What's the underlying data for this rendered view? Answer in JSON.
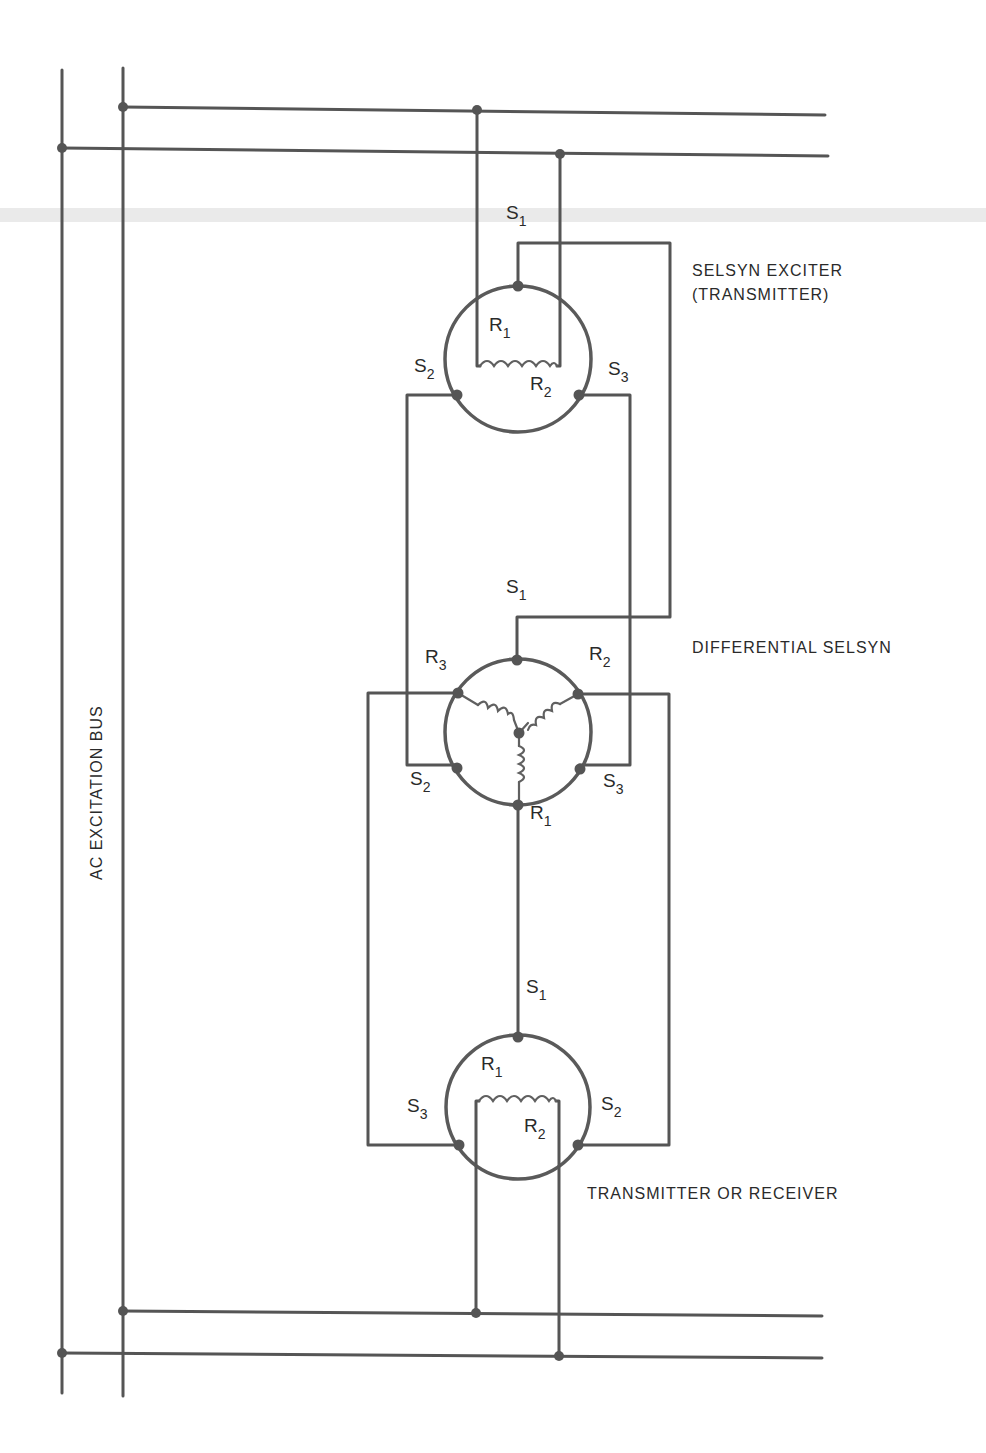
{
  "diagram": {
    "bus_label": "AC EXCITATION BUS",
    "colors": {
      "wire": "#555555",
      "background": "#ffffff",
      "text": "#2a2a2a"
    },
    "units": [
      {
        "id": "exciter",
        "caption_line1": "SELSYN EXCITER",
        "caption_line2": "(TRANSMITTER)",
        "terminals": {
          "s1": "S",
          "s1_sub": "1",
          "s2": "S",
          "s2_sub": "2",
          "s3": "S",
          "s3_sub": "3",
          "r1": "R",
          "r1_sub": "1",
          "r2": "R",
          "r2_sub": "2"
        }
      },
      {
        "id": "differential",
        "caption_line1": "DIFFERENTIAL SELSYN",
        "terminals": {
          "s1": "S",
          "s1_sub": "1",
          "s2": "S",
          "s2_sub": "2",
          "s3": "S",
          "s3_sub": "3",
          "r1": "R",
          "r1_sub": "1",
          "r2": "R",
          "r2_sub": "2",
          "r3": "R",
          "r3_sub": "3"
        }
      },
      {
        "id": "receiver",
        "caption_line1": "TRANSMITTER OR RECEIVER",
        "terminals": {
          "s1": "S",
          "s1_sub": "1",
          "s2": "S",
          "s2_sub": "2",
          "s3": "S",
          "s3_sub": "3",
          "r1": "R",
          "r1_sub": "1",
          "r2": "R",
          "r2_sub": "2"
        }
      }
    ]
  }
}
